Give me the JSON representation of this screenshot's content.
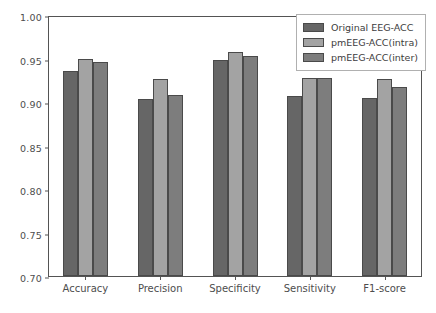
{
  "chart_data": {
    "type": "bar",
    "title": "",
    "xlabel": "",
    "ylabel": "",
    "ylim": [
      0.7,
      1.0
    ],
    "yticks": [
      "0.70",
      "0.75",
      "0.80",
      "0.85",
      "0.90",
      "0.95",
      "1.00"
    ],
    "ytick_values": [
      0.7,
      0.75,
      0.8,
      0.85,
      0.9,
      0.95,
      1.0
    ],
    "grid": false,
    "legend_position": "upper right",
    "categories": [
      "Accuracy",
      "Precision",
      "Specificity",
      "Sensitivity",
      "F1-score"
    ],
    "series": [
      {
        "name": "Original EEG-ACC",
        "color": "#666666",
        "values": [
          0.936,
          0.903,
          0.948,
          0.907,
          0.905
        ]
      },
      {
        "name": "pmEEG-ACC(intra)",
        "color": "#a3a3a3",
        "values": [
          0.95,
          0.927,
          0.958,
          0.928,
          0.926
        ]
      },
      {
        "name": "pmEEG-ACC(inter)",
        "color": "#7d7d7d",
        "values": [
          0.946,
          0.908,
          0.953,
          0.928,
          0.917
        ]
      }
    ]
  },
  "axis": {
    "tick_color": "#545454",
    "label_color": "#4d4d4d"
  },
  "legend": {
    "entries": [
      {
        "label": "Original EEG-ACC",
        "color": "#666666"
      },
      {
        "label": "pmEEG-ACC(intra)",
        "color": "#a3a3a3"
      },
      {
        "label": "pmEEG-ACC(inter)",
        "color": "#7d7d7d"
      }
    ]
  }
}
